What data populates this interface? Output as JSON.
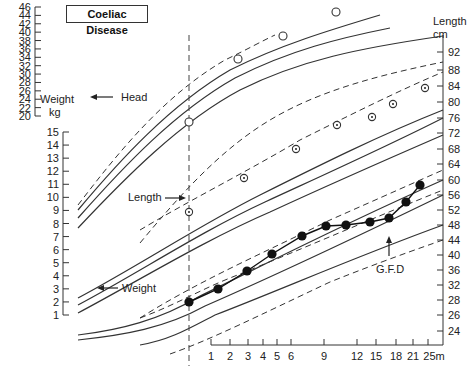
{
  "chart_data": {
    "type": "line",
    "title": "Coeliac Disease",
    "xlabel": "Age (months)",
    "x_ticks": [
      "1",
      "2",
      "3",
      "4",
      "5",
      "6",
      "9",
      "12",
      "15",
      "18",
      "21",
      "25m"
    ],
    "left_axis_outer": {
      "label": "Weight kg",
      "ticks": [
        46,
        44,
        42,
        40,
        38,
        36,
        34,
        32,
        30,
        28,
        26,
        24,
        22,
        20
      ]
    },
    "left_axis_inner": {
      "ticks": [
        15,
        14,
        13,
        12,
        11,
        10,
        9,
        8,
        7,
        6,
        5,
        4,
        3,
        2,
        1
      ]
    },
    "right_axis": {
      "label": "Length cm",
      "label_line1": "Length",
      "label_line2": "cm",
      "ticks": [
        92,
        88,
        84,
        80,
        76,
        72,
        68,
        64,
        60,
        56,
        52,
        48,
        44,
        40,
        36,
        32,
        28,
        26,
        24
      ]
    },
    "annotations": {
      "head": "Head",
      "length": "Length",
      "weight": "Weight",
      "gfd": "G.F.D"
    },
    "series": [
      {
        "name": "Head circumference (cm)",
        "marker": "open-circle",
        "x": [
          0.5,
          2.5,
          5.5,
          10
        ],
        "y": [
          35,
          39.8,
          42.5,
          45.6
        ]
      },
      {
        "name": "Length (cm)",
        "marker": "dotted-circle",
        "x": [
          0.5,
          2.8,
          6.5,
          10.5,
          14.5,
          18,
          24
        ],
        "y": [
          58.5,
          64.5,
          70.5,
          75.5,
          77,
          80,
          83.5
        ]
      },
      {
        "name": "Weight (kg)",
        "marker": "filled-circle",
        "x": [
          0.5,
          1.5,
          3,
          4.5,
          6.5,
          9,
          11,
          14,
          17,
          19.5,
          22
        ],
        "y": [
          3.8,
          4.8,
          5.8,
          7.1,
          8.4,
          9.1,
          9.2,
          9.3,
          9.6,
          10.8,
          12.1
        ]
      }
    ],
    "gfd_marker_age_months": 14,
    "vertical_dashed_line_age": 0.5,
    "grid": false
  }
}
